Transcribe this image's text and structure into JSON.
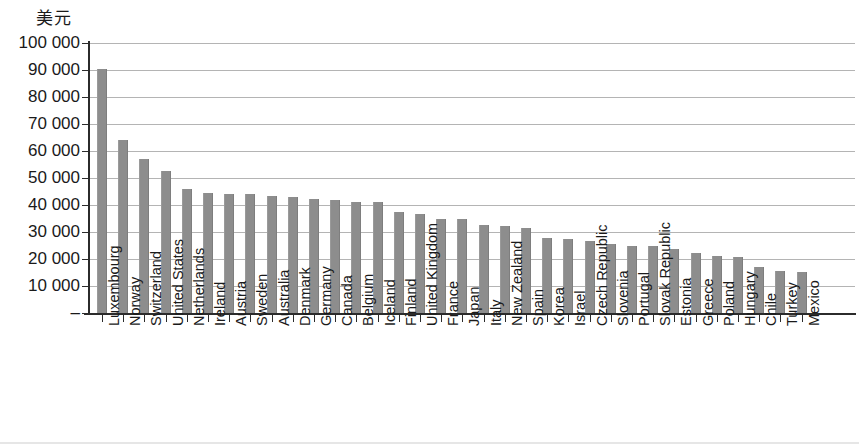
{
  "chart_data": {
    "type": "bar",
    "title": "",
    "subtitle": "",
    "ylabel": "美元",
    "xlabel": "",
    "ylim": [
      0,
      100000
    ],
    "ytick_labels": [
      "100 000",
      "90 000",
      "80 000",
      "70 000",
      "60 000",
      "50 000",
      "40 000",
      "30 000",
      "20 000",
      "10 000",
      "–"
    ],
    "ytick_values": [
      100000,
      90000,
      80000,
      70000,
      60000,
      50000,
      40000,
      30000,
      20000,
      10000,
      0
    ],
    "grid": true,
    "legend": null,
    "bar_color": "#8d8d8d",
    "categories": [
      "Luxembourg",
      "Norway",
      "Switzerland",
      "United States",
      "Netherlands",
      "Ireland",
      "Austria",
      "Sweden",
      "Australia",
      "Denmark",
      "Germany",
      "Canada",
      "Belgium",
      "Iceland",
      "Finland",
      "United Kingdom",
      "France",
      "Japan",
      "Italy",
      "New Zealand",
      "Spain",
      "Korea",
      "Israel",
      "Czech Republic",
      "Slovenia",
      "Portugal",
      "Slovak Republic",
      "Estonia",
      "Greece",
      "Poland",
      "Hungary",
      "Chile",
      "Turkey",
      "Mexico"
    ],
    "values": [
      90500,
      64000,
      57000,
      52500,
      45800,
      44500,
      44200,
      44000,
      43300,
      43000,
      42300,
      41800,
      41300,
      41000,
      37500,
      36500,
      35000,
      34700,
      32700,
      32200,
      31500,
      27800,
      27500,
      26800,
      25500,
      25000,
      24800,
      23800,
      22300,
      21000,
      20800,
      17200,
      15500,
      15300
    ]
  }
}
